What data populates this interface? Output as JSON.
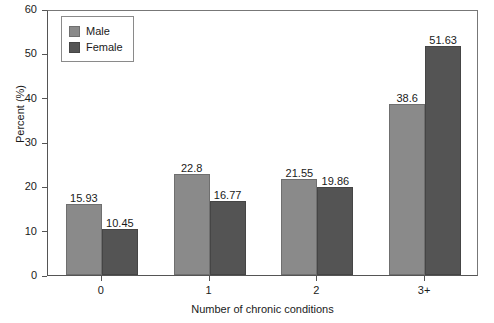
{
  "chart_data": {
    "type": "bar",
    "title": "",
    "xlabel": "Number of chronic conditions",
    "ylabel": "Percent (%)",
    "categories": [
      "0",
      "1",
      "2",
      "3+"
    ],
    "series": [
      {
        "name": "Male",
        "color": "#8a8a8a",
        "values": [
          15.93,
          22.8,
          21.55,
          38.6
        ]
      },
      {
        "name": "Female",
        "color": "#545454",
        "values": [
          10.45,
          16.77,
          19.86,
          51.63
        ]
      }
    ],
    "value_labels": {
      "male": [
        "15.93",
        "22.8",
        "21.55",
        "38.6"
      ],
      "female": [
        "10.45",
        "16.77",
        "19.86",
        "51.63"
      ]
    },
    "ylim": [
      0,
      60
    ],
    "yticks": [
      0,
      10,
      20,
      30,
      40,
      50,
      60
    ],
    "ytick_labels": [
      "0",
      "10",
      "20",
      "30",
      "40",
      "50",
      "60"
    ],
    "grid": false,
    "legend_position": "top-left",
    "legend_entries": [
      "Male",
      "Female"
    ]
  }
}
